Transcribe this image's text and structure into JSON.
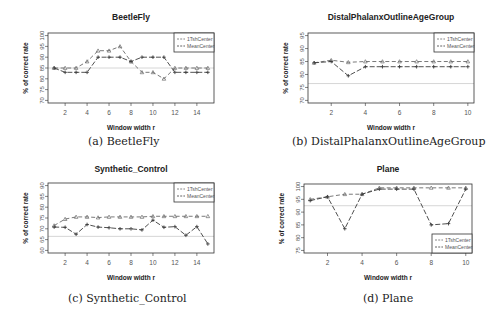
{
  "chart_data": [
    {
      "id": "a",
      "type": "line",
      "title": "BeetleFly",
      "caption": "(a) BeetleFly",
      "xlabel": "Window width r",
      "ylabel": "% of correct rate",
      "xlim": [
        1,
        15
      ],
      "ylim": [
        70,
        100
      ],
      "xticks": [
        2,
        4,
        6,
        8,
        10,
        12,
        14
      ],
      "yticks": [
        70,
        75,
        80,
        85,
        90,
        95,
        100
      ],
      "reference_line": 85,
      "legend_position": "top-right",
      "x": [
        1,
        2,
        3,
        4,
        5,
        6,
        7,
        8,
        9,
        10,
        11,
        12,
        13,
        14,
        15
      ],
      "series": [
        {
          "name": "1TshCenter",
          "values": [
            85,
            85,
            85,
            88,
            93,
            93,
            95,
            88,
            83,
            83,
            80,
            85,
            85,
            85,
            85
          ]
        },
        {
          "name": "MeanCenter",
          "values": [
            85,
            83,
            83,
            83,
            90,
            90,
            90,
            88,
            90,
            90,
            90,
            83,
            83,
            83,
            83
          ]
        }
      ]
    },
    {
      "id": "b",
      "type": "line",
      "title": "DistalPhalanxOutlineAgeGroup",
      "caption": "(b) DistalPhalanxOutlineAgeGroup",
      "xlabel": "Window width r",
      "ylabel": "% of correct rate",
      "xlim": [
        1,
        10
      ],
      "ylim": [
        70,
        95
      ],
      "xticks": [
        2,
        4,
        6,
        8,
        10
      ],
      "yticks": [
        70,
        75,
        80,
        85,
        90,
        95
      ],
      "reference_line": 76.5,
      "legend_position": "top-right",
      "x": [
        1,
        2,
        3,
        4,
        5,
        6,
        7,
        8,
        9,
        10
      ],
      "series": [
        {
          "name": "1TshCenter",
          "values": [
            84.5,
            85.5,
            84.7,
            85,
            85,
            85,
            85,
            85,
            85,
            85
          ]
        },
        {
          "name": "MeanCenter",
          "values": [
            84.5,
            85,
            79.5,
            83,
            83,
            83,
            83,
            83,
            83,
            83
          ]
        }
      ]
    },
    {
      "id": "c",
      "type": "line",
      "title": "Synthetic_Control",
      "caption": "(c) Synthetic_Control",
      "xlabel": "Window width r",
      "ylabel": "% of correct rate",
      "xlim": [
        1,
        15
      ],
      "ylim": [
        60,
        90
      ],
      "xticks": [
        2,
        4,
        6,
        8,
        10,
        12,
        14
      ],
      "yticks": [
        60,
        65,
        70,
        75,
        80,
        85,
        90
      ],
      "reference_line": 66.5,
      "legend_position": "top-right",
      "x": [
        1,
        2,
        3,
        4,
        5,
        6,
        7,
        8,
        9,
        10,
        11,
        12,
        13,
        14,
        15
      ],
      "series": [
        {
          "name": "1TshCenter",
          "values": [
            71.5,
            74.5,
            75.5,
            75.5,
            75.2,
            75.5,
            75.5,
            75.5,
            75.5,
            75.8,
            75.8,
            75.8,
            75.8,
            75.8,
            75.8
          ]
        },
        {
          "name": "MeanCenter",
          "values": [
            70.8,
            70.7,
            67.5,
            72,
            70.8,
            70.5,
            70,
            70,
            69.5,
            74,
            70.7,
            71,
            67,
            71,
            63
          ]
        }
      ]
    },
    {
      "id": "d",
      "type": "line",
      "title": "Plane",
      "caption": "(d) Plane",
      "xlabel": "Window width r",
      "ylabel": "% of correct rate",
      "xlim": [
        1,
        10
      ],
      "ylim": [
        75,
        100
      ],
      "xticks": [
        2,
        4,
        6,
        8,
        10
      ],
      "yticks": [
        75,
        80,
        85,
        90,
        95,
        100
      ],
      "reference_line": 92.5,
      "legend_position": "bottom-right",
      "x": [
        1,
        2,
        3,
        4,
        5,
        6,
        7,
        8,
        9,
        10
      ],
      "series": [
        {
          "name": "1TshCenter",
          "values": [
            95,
            96,
            97,
            97,
            99.5,
            99.5,
            99.5,
            99.5,
            99.5,
            99.5
          ]
        },
        {
          "name": "MeanCenter",
          "values": [
            94.5,
            96,
            83.5,
            97,
            99,
            99,
            99,
            85,
            85.5,
            99
          ]
        }
      ]
    }
  ],
  "colors": {
    "series_a": "#6a6a6a",
    "series_b": "#3c3c3c",
    "reference": "#cccccc",
    "axis": "#333333",
    "text": "#222222"
  }
}
